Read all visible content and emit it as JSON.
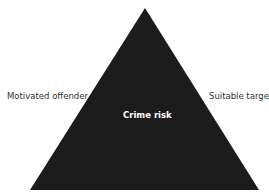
{
  "diagram": {
    "type": "crime-triangle",
    "center_label": "Crime risk",
    "left_label": "Motivated offender",
    "right_label": "Suitable target",
    "colors": {
      "triangle_fill": "#1c1c1c",
      "label_text": "#333333",
      "center_text": "#ffffff",
      "background": "#ffffff"
    }
  }
}
